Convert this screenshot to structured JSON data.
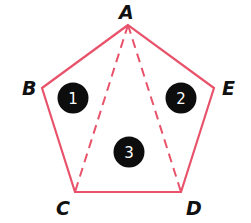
{
  "diagram": {
    "type": "pentagon-triangulation",
    "colors": {
      "edge": "#e8536b",
      "region_fill": "#0d0d0d",
      "region_text": "#ffffff",
      "label": "#111111"
    },
    "vertices": [
      {
        "id": "A",
        "label": "A",
        "x": 128,
        "y": 25
      },
      {
        "id": "B",
        "label": "B",
        "x": 42,
        "y": 88
      },
      {
        "id": "C",
        "label": "C",
        "x": 75,
        "y": 192
      },
      {
        "id": "D",
        "label": "D",
        "x": 181,
        "y": 192
      },
      {
        "id": "E",
        "label": "E",
        "x": 214,
        "y": 88
      }
    ],
    "edges": [
      {
        "from": "A",
        "to": "B",
        "style": "solid"
      },
      {
        "from": "B",
        "to": "C",
        "style": "solid"
      },
      {
        "from": "C",
        "to": "D",
        "style": "solid"
      },
      {
        "from": "D",
        "to": "E",
        "style": "solid"
      },
      {
        "from": "E",
        "to": "A",
        "style": "solid"
      }
    ],
    "diagonals": [
      {
        "from": "A",
        "to": "C",
        "style": "dashed"
      },
      {
        "from": "A",
        "to": "D",
        "style": "dashed"
      }
    ],
    "regions": [
      {
        "label": "1",
        "triangle": "ABC"
      },
      {
        "label": "2",
        "triangle": "ADE"
      },
      {
        "label": "3",
        "triangle": "ACD"
      }
    ]
  }
}
